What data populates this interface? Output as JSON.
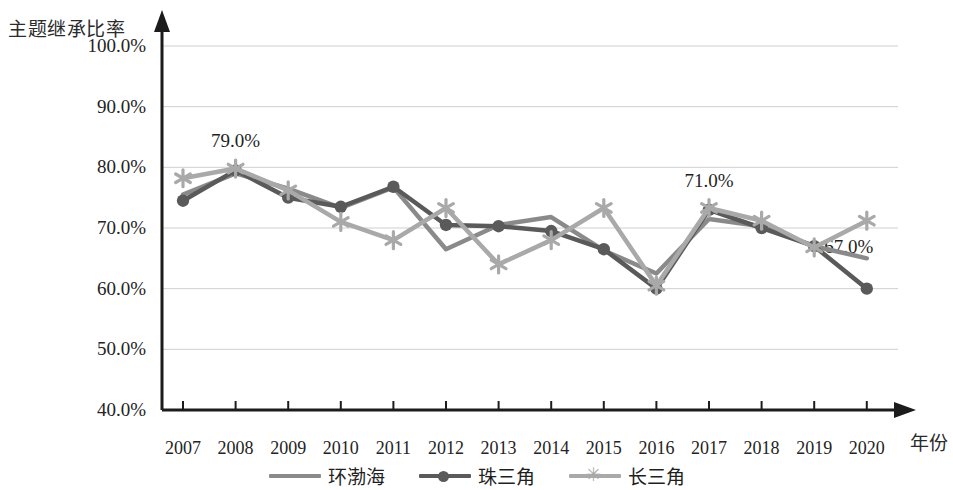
{
  "axes": {
    "y_title": "主题继承比率",
    "x_title": "年份",
    "y_ticks": [
      "100.0%",
      "90.0%",
      "80.0%",
      "70.0%",
      "60.0%",
      "50.0%",
      "40.0%"
    ],
    "x_ticks": [
      "2007",
      "2008",
      "2009",
      "2010",
      "2011",
      "2012",
      "2013",
      "2014",
      "2015",
      "2016",
      "2017",
      "2018",
      "2019",
      "2020"
    ]
  },
  "legend": [
    {
      "label": "环渤海",
      "marker": "none",
      "color": "#8a8a8a"
    },
    {
      "label": "珠三角",
      "marker": "circle",
      "color": "#5a5a5a"
    },
    {
      "label": "长三角",
      "marker": "asterisk",
      "color": "#a9a9a9"
    }
  ],
  "annotations": [
    {
      "text": "79.0%",
      "x": 2008,
      "y": 84.0
    },
    {
      "text": "71.0%",
      "x": 2017,
      "y": 77.5
    },
    {
      "text": "67.0%",
      "x": 2020,
      "y": 66.5
    }
  ],
  "chart_data": {
    "type": "line",
    "title": "",
    "xlabel": "年份",
    "ylabel": "主题继承比率",
    "ylim": [
      40,
      100
    ],
    "ytick_step": 10,
    "grid": true,
    "legend_position": "bottom",
    "categories": [
      "2007",
      "2008",
      "2009",
      "2010",
      "2011",
      "2012",
      "2013",
      "2014",
      "2015",
      "2016",
      "2017",
      "2018",
      "2019",
      "2020"
    ],
    "series": [
      {
        "name": "环渤海",
        "marker": "none",
        "color": "#8a8a8a",
        "values": [
          75.5,
          79.0,
          76.5,
          73.3,
          76.7,
          66.5,
          70.5,
          71.8,
          66.3,
          62.5,
          71.5,
          70.3,
          67.0,
          65.0
        ]
      },
      {
        "name": "珠三角",
        "marker": "circle",
        "color": "#5a5a5a",
        "values": [
          74.5,
          79.5,
          75.0,
          73.5,
          76.8,
          70.5,
          70.3,
          69.5,
          66.5,
          60.0,
          73.0,
          70.0,
          67.0,
          60.0
        ]
      },
      {
        "name": "长三角",
        "marker": "asterisk",
        "color": "#a9a9a9",
        "values": [
          78.2,
          79.8,
          76.2,
          71.0,
          68.0,
          73.3,
          64.0,
          68.0,
          73.3,
          60.5,
          73.3,
          71.2,
          66.8,
          71.2
        ]
      }
    ]
  }
}
